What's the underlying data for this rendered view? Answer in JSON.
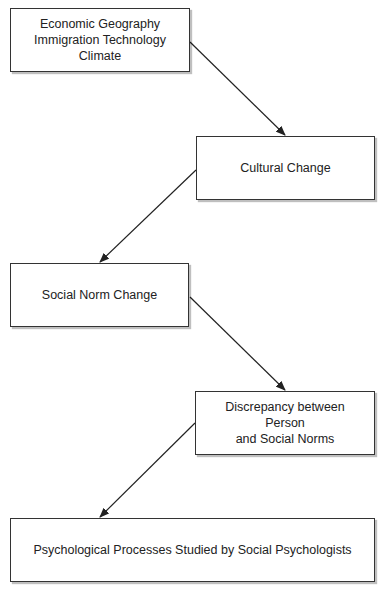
{
  "diagram": {
    "nodes": [
      {
        "id": "drivers",
        "lines": [
          "Economic Geography",
          "Immigration Technology",
          "Climate"
        ]
      },
      {
        "id": "cultural-change",
        "lines": [
          "Cultural Change"
        ]
      },
      {
        "id": "social-norm-change",
        "lines": [
          "Social Norm Change"
        ]
      },
      {
        "id": "discrepancy",
        "lines": [
          "Discrepancy between",
          "Person",
          "and Social Norms"
        ]
      },
      {
        "id": "psych-processes",
        "lines": [
          "Psychological Processes Studied by Social Psychologists"
        ]
      }
    ],
    "edges": [
      {
        "from": "drivers",
        "to": "cultural-change"
      },
      {
        "from": "cultural-change",
        "to": "social-norm-change"
      },
      {
        "from": "social-norm-change",
        "to": "discrepancy"
      },
      {
        "from": "discrepancy",
        "to": "psych-processes"
      }
    ]
  }
}
